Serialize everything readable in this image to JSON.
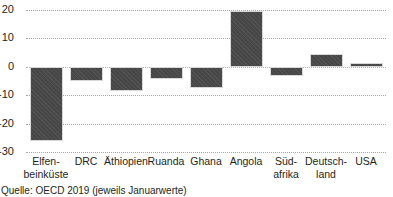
{
  "chart_data": {
    "type": "bar",
    "title": "",
    "subtitle": "",
    "xlabel": "",
    "ylabel": "",
    "ylim": [
      -30,
      20
    ],
    "yticks": [
      20,
      10,
      0,
      -10,
      -20,
      -30
    ],
    "ytick_labels": [
      "20",
      "10",
      "0",
      "-10",
      "-20",
      "-30"
    ],
    "grid": true,
    "legend": null,
    "bar_color": "#474747",
    "categories": [
      "Elfen-\nbeinküste",
      "DRC",
      "Äthiopien",
      "Ruanda",
      "Ghana",
      "Angola",
      "Süd-\nafrika",
      "Deutsch-\nland",
      "USA"
    ],
    "values": [
      -26.1,
      -5.0,
      -8.4,
      -4.2,
      -7.3,
      19.5,
      -3.3,
      4.5,
      1.2
    ]
  },
  "caption": {
    "source": "Quelle: OECD 2019 (jeweils Januarwerte)"
  }
}
